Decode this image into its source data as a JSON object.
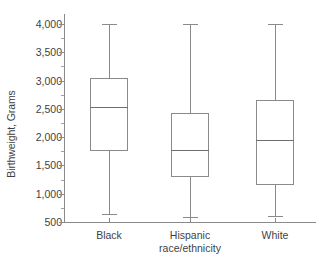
{
  "chart_data": {
    "type": "box",
    "title": "",
    "xlabel": "race/ethnicity",
    "ylabel": "Birthweight, Grams",
    "ylim": [
      500,
      4000
    ],
    "ytick_labels": [
      "4,000",
      "3,500",
      "3,000",
      "2,500",
      "2,000",
      "1,500",
      "1,000",
      "500"
    ],
    "ytick_values": [
      4000,
      3500,
      3000,
      2500,
      2000,
      1500,
      1000,
      500
    ],
    "yminor_values": [
      3750,
      3250,
      2750,
      2250,
      1750,
      1250,
      750
    ],
    "grid": false,
    "legend": "none",
    "categories": [
      "Black",
      "Hispanic",
      "White"
    ],
    "boxes": [
      {
        "category": "Black",
        "whisker_low": 650,
        "q1": 1760,
        "median": 2530,
        "q3": 3050,
        "whisker_high": 4000
      },
      {
        "category": "Hispanic",
        "whisker_low": 580,
        "q1": 1290,
        "median": 1770,
        "q3": 2430,
        "whisker_high": 4000
      },
      {
        "category": "White",
        "whisker_low": 610,
        "q1": 1160,
        "median": 1950,
        "q3": 2660,
        "whisker_high": 4000
      }
    ],
    "colors": {
      "box_stroke": "#8a8a8a",
      "median_stroke": "#6e6e6e",
      "axis": "#8a8a8a",
      "text": "#3f3f3f",
      "background": "#ffffff"
    }
  }
}
